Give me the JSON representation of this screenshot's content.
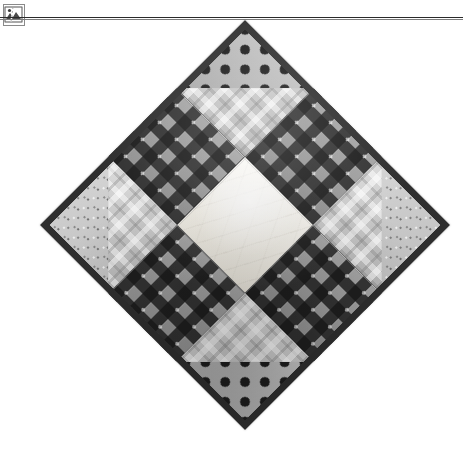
{
  "page": {
    "background_color": "#ffffff",
    "width": 463,
    "height": 451
  },
  "chrome": {
    "rule_color": "#2b2b2b",
    "broken_image_icon": "broken-image-icon",
    "broken_image_alt": ""
  },
  "photo": {
    "subject": "Patchwork quilt block displayed on point (rotated 45 degrees)",
    "pattern_name": "Nine-patch shoofly block",
    "binding_color": "#2e2e2e",
    "patches": [
      {
        "position": "top-left",
        "name": "pinwheel-corner-top-left",
        "fabric_a": "polka-dot",
        "fabric_b": "light-plaid"
      },
      {
        "position": "top-center",
        "name": "gingham-arm-top",
        "fabric_a": "gingham-check",
        "fabric_b": ""
      },
      {
        "position": "top-right",
        "name": "pinwheel-corner-top-right",
        "fabric_a": "speckled-light",
        "fabric_b": "light-plaid"
      },
      {
        "position": "middle-left",
        "name": "gingham-arm-left",
        "fabric_a": "gingham-check",
        "fabric_b": ""
      },
      {
        "position": "center",
        "name": "center-cream-square",
        "fabric_a": "cream-solid",
        "fabric_b": ""
      },
      {
        "position": "middle-right",
        "name": "gingham-arm-right",
        "fabric_a": "gingham-check",
        "fabric_b": ""
      },
      {
        "position": "bottom-left",
        "name": "pinwheel-corner-bottom-left",
        "fabric_a": "speckled-light",
        "fabric_b": "light-plaid"
      },
      {
        "position": "bottom-center",
        "name": "gingham-arm-bottom",
        "fabric_a": "gingham-check",
        "fabric_b": ""
      },
      {
        "position": "bottom-right",
        "name": "pinwheel-corner-bottom-right",
        "fabric_a": "polka-dot",
        "fabric_b": "light-plaid"
      }
    ],
    "colors": {
      "gingham_dark": "#1d1d1d",
      "gingham_mid": "#9a9a9a",
      "cream": "#f6f3ec",
      "dot_ground": "#b9b9b9",
      "plaid_light": "#cfcfcf",
      "speckle": "#c9c9c9"
    }
  }
}
